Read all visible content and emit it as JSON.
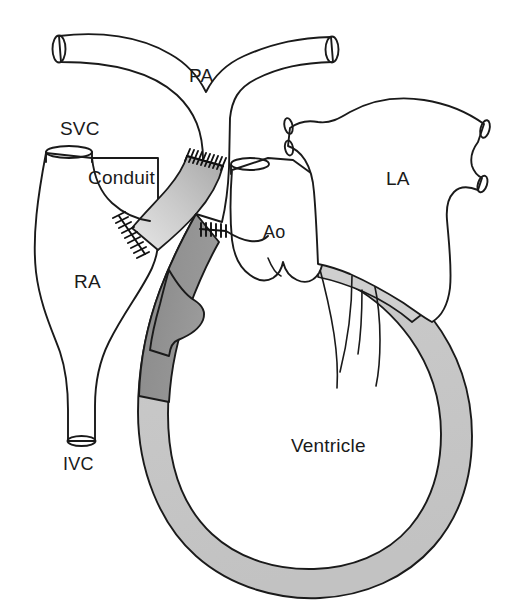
{
  "figure": {
    "kind": "anatomical-line-diagram",
    "background_color": "#ffffff",
    "line_color": "#1a1a1a"
  },
  "labels": {
    "svc": "SVC",
    "conduit": "Conduit",
    "pa": "PA",
    "la": "LA",
    "ao": "Ao",
    "ra": "RA",
    "ivc": "IVC",
    "ventricle": "Ventricle"
  },
  "structures": [
    {
      "id": "svc",
      "name": "SVC",
      "full_name": "superior vena cava",
      "fill": "#ffffff"
    },
    {
      "id": "ra",
      "name": "RA",
      "full_name": "right atrium",
      "fill": "#ffffff"
    },
    {
      "id": "ivc",
      "name": "IVC",
      "full_name": "inferior vena cava",
      "fill": "#ffffff"
    },
    {
      "id": "conduit",
      "name": "Conduit",
      "full_name": "extracardiac conduit",
      "fill": "#c9c9c9"
    },
    {
      "id": "pa",
      "name": "PA",
      "full_name": "pulmonary artery",
      "fill": "#ffffff"
    },
    {
      "id": "la",
      "name": "LA",
      "full_name": "left atrium",
      "fill": "#ffffff"
    },
    {
      "id": "ao",
      "name": "Ao",
      "full_name": "aorta",
      "fill": "#ffffff"
    },
    {
      "id": "ventricle",
      "name": "Ventricle",
      "full_name": "single ventricle",
      "fill": "#ffffff"
    }
  ],
  "shading": {
    "myocardium_light": "#c8c8c8",
    "myocardium_dark": "#8f8f8f",
    "conduit_light": "#d8d8d8",
    "conduit_mid": "#bdbdbd",
    "conduit_dark": "#a0a0a0"
  },
  "suture_lines": [
    {
      "id": "conduit-to-pa",
      "name": "conduit-pulmonary-artery-anastomosis",
      "stitch_count": 9
    },
    {
      "id": "conduit-to-ra",
      "name": "conduit-right-atrium-anastomosis",
      "stitch_count": 9
    },
    {
      "id": "ventriculotomy",
      "name": "ventricular-outflow-suture-line",
      "stitch_count": 5
    }
  ],
  "vessel_stumps": [
    {
      "id": "svc-cut-end",
      "name": "svc-open-end"
    },
    {
      "id": "ivc-cut-end",
      "name": "ivc-open-end"
    },
    {
      "id": "pa-left-cut",
      "name": "left-pulmonary-artery-open-end"
    },
    {
      "id": "pa-right-cut",
      "name": "right-pulmonary-artery-open-end"
    },
    {
      "id": "ao-cut",
      "name": "aorta-open-end"
    },
    {
      "id": "lpv-sup",
      "name": "left-superior-pulmonary-vein-stump"
    },
    {
      "id": "lpv-inf",
      "name": "left-inferior-pulmonary-vein-stump"
    },
    {
      "id": "rpv-sup",
      "name": "right-superior-pulmonary-vein-stump"
    },
    {
      "id": "rpv-inf",
      "name": "right-inferior-pulmonary-vein-stump"
    }
  ]
}
